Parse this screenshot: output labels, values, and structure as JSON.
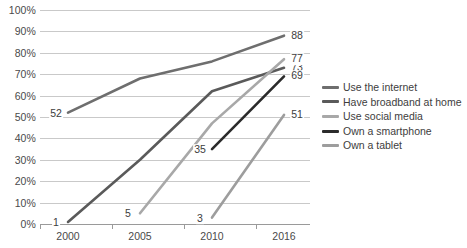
{
  "chart_data": {
    "type": "line",
    "title": "",
    "xlabel": "",
    "ylabel": "",
    "x": [
      "2000",
      "2005",
      "2010",
      "2016"
    ],
    "ylim": [
      0,
      100
    ],
    "ytick_labels": [
      "0%",
      "10%",
      "20%",
      "30%",
      "40%",
      "50%",
      "60%",
      "70%",
      "80%",
      "90%",
      "100%"
    ],
    "ytick_values": [
      0,
      10,
      20,
      30,
      40,
      50,
      60,
      70,
      80,
      90,
      100
    ],
    "grid": true,
    "legend_position": "right",
    "series": [
      {
        "name": "Use the internet",
        "color": "#6e6e6e",
        "values": [
          52,
          68,
          76,
          88
        ],
        "start_label": "52",
        "end_label": "88"
      },
      {
        "name": "Have broadband at home",
        "color": "#5a5a5a",
        "values": [
          1,
          30,
          62,
          73
        ],
        "start_label": "1",
        "end_label": "73"
      },
      {
        "name": "Use social media",
        "color": "#a8a8a8",
        "values": [
          null,
          5,
          47,
          77
        ],
        "start_label": "5",
        "end_label": "77"
      },
      {
        "name": "Own a smartphone",
        "color": "#2b2b2b",
        "values": [
          null,
          null,
          35,
          69
        ],
        "start_label": "35",
        "end_label": "69"
      },
      {
        "name": "Own a tablet",
        "color": "#9d9d9d",
        "values": [
          null,
          null,
          3,
          51
        ],
        "start_label": "3",
        "end_label": "51"
      }
    ]
  }
}
